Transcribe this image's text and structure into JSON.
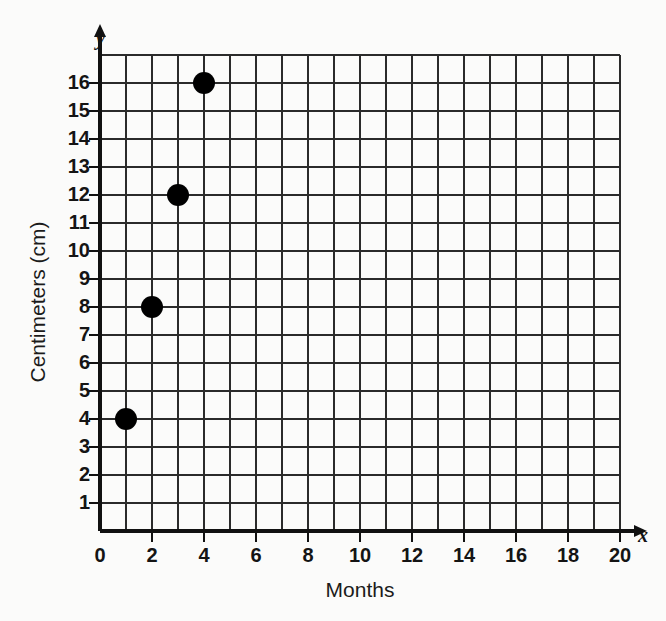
{
  "chart_data": {
    "type": "scatter",
    "title": "",
    "xlabel": "Months",
    "ylabel": "Centimeters (cm)",
    "x_axis_variable": "x",
    "y_axis_variable": "y",
    "xlim": [
      0,
      20
    ],
    "ylim": [
      0,
      17
    ],
    "grid": true,
    "grid_step_x": 1,
    "grid_step_y": 1,
    "legend": "none",
    "points": [
      {
        "x": 1,
        "y": 4
      },
      {
        "x": 2,
        "y": 8
      },
      {
        "x": 3,
        "y": 12
      },
      {
        "x": 4,
        "y": 16
      }
    ],
    "x_tick_labels": [
      "0",
      "2",
      "4",
      "6",
      "8",
      "10",
      "12",
      "14",
      "16",
      "18",
      "20"
    ],
    "x_tick_values": [
      0,
      2,
      4,
      6,
      8,
      10,
      12,
      14,
      16,
      18,
      20
    ],
    "y_tick_labels": [
      "1",
      "2",
      "3",
      "4",
      "5",
      "6",
      "7",
      "8",
      "9",
      "10",
      "11",
      "12",
      "13",
      "14",
      "15",
      "16"
    ],
    "y_tick_values": [
      1,
      2,
      3,
      4,
      5,
      6,
      7,
      8,
      9,
      10,
      11,
      12,
      13,
      14,
      15,
      16
    ],
    "origin_label": "0",
    "colors": {
      "background": "#fbfbfa",
      "grid": "#2b2b2b",
      "axis": "#111111",
      "point": "#000000",
      "text": "#141414"
    }
  },
  "labels": {
    "x_axis_title": "Months",
    "y_axis_title": "Centimeters (cm)",
    "x_var": "x",
    "y_var": "y",
    "origin": "0",
    "y_16": "16",
    "y_15": "15",
    "y_14": "14",
    "y_13": "13",
    "y_12": "12",
    "y_11": "11",
    "y_10": "10",
    "y_9": "9",
    "y_8": "8",
    "y_7": "7",
    "y_6": "6",
    "y_5": "5",
    "y_4": "4",
    "y_3": "3",
    "y_2": "2",
    "y_1": "1",
    "x_0": "0",
    "x_2": "2",
    "x_4": "4",
    "x_6": "6",
    "x_8": "8",
    "x_10": "10",
    "x_12": "12",
    "x_14": "14",
    "x_16": "16",
    "x_18": "18",
    "x_20": "20"
  }
}
